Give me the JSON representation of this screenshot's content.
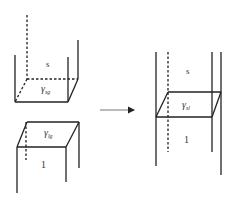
{
  "diagram": {
    "left": {
      "upper_block": {
        "phase_label": "s",
        "surface_symbol": "γ",
        "surface_subscript": "sg"
      },
      "lower_block": {
        "phase_label": "l",
        "phase_display": "1",
        "surface_symbol": "γ",
        "surface_subscript": "lg"
      }
    },
    "arrow": {
      "direction": "right"
    },
    "right": {
      "upper_phase_label": "s",
      "lower_phase_display": "1",
      "interface_symbol": "γ",
      "interface_subscript": "sl"
    },
    "colors": {
      "line": "#222222",
      "text": "#333333",
      "background": "#ffffff"
    }
  }
}
